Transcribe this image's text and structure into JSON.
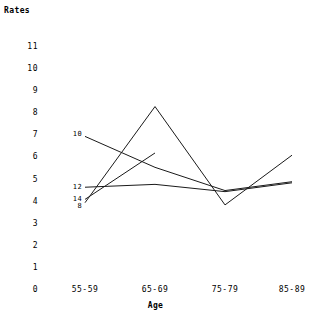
{
  "chart_data": {
    "type": "line",
    "title": "",
    "xlabel": "Age",
    "ylabel": "Rates",
    "categories": [
      "55-59",
      "65-69",
      "75-79",
      "85-89"
    ],
    "ylim": [
      0,
      11
    ],
    "xlim_px": [
      85,
      292
    ],
    "yticks": [
      0,
      1,
      2,
      3,
      4,
      5,
      6,
      7,
      8,
      9,
      10,
      11
    ],
    "grid": false,
    "legend_position": "inline-left-of-first-point",
    "series": [
      {
        "name": "10",
        "label": "10",
        "label_x": 85,
        "label_y": 7.05,
        "values": [
          6.95,
          5.55,
          4.5,
          4.9
        ]
      },
      {
        "name": "8",
        "label": "8",
        "label_x": 85,
        "label_y": 3.8,
        "values": [
          3.95,
          8.3,
          3.85,
          6.1
        ]
      },
      {
        "name": "12",
        "label": "12",
        "label_x": 85,
        "label_y": 4.65,
        "values": [
          4.65,
          4.78,
          4.45,
          4.85
        ]
      },
      {
        "name": "14",
        "label": "14",
        "label_x": 85,
        "label_y": 4.1,
        "values": [
          4.1,
          6.2,
          null,
          null
        ]
      }
    ]
  }
}
